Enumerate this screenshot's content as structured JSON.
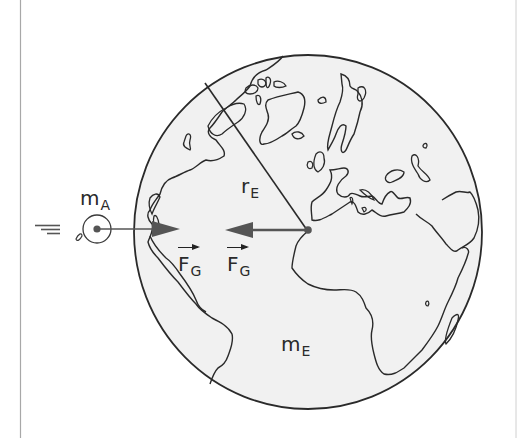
{
  "diagram": {
    "labels": {
      "small_mass": {
        "main": "m",
        "sub": "A"
      },
      "earth_mass": {
        "main": "m",
        "sub": "E"
      },
      "earth_radius": {
        "main": "r",
        "sub": "E"
      },
      "force_on_mass": {
        "main": "F",
        "sub": "G",
        "vector": true
      },
      "force_on_earth": {
        "main": "F",
        "sub": "G",
        "vector": true
      }
    },
    "elements": {
      "globe": "Earth globe outline showing Americas, Greenland, Europe and Africa",
      "radius_line": "line from globe surface to center",
      "arrow_toward_earth": "force on m_A pointing right toward Earth",
      "arrow_toward_mass": "force on Earth pointing left toward m_A",
      "small_mass_symbol": "apple-like circle with center dot and motion lines"
    },
    "colors": {
      "background": "#ffffff",
      "globe_fill": "#f1f1f1",
      "line": "#2a2a2a",
      "arrow": "#555555",
      "border": "#a8a8a8"
    }
  }
}
